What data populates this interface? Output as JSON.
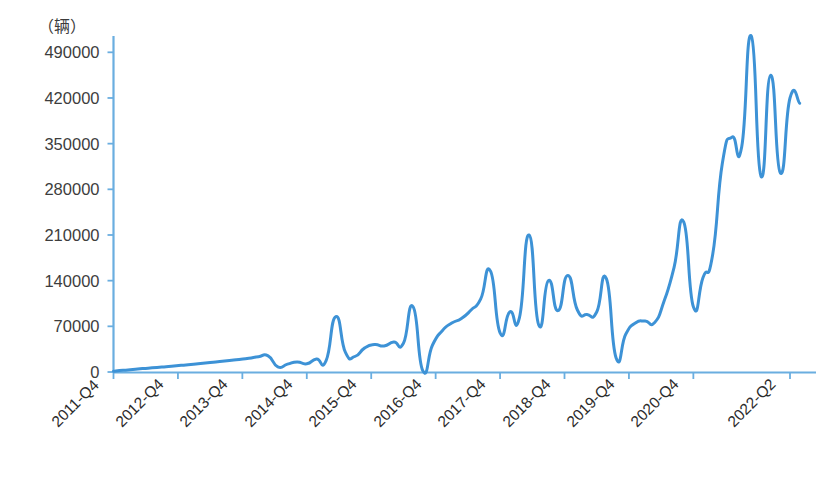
{
  "chart_data": {
    "type": "line",
    "title": "",
    "subtitle": "",
    "unit_label": "（辆）",
    "xlabel": "",
    "ylabel": "",
    "ylim": [
      0,
      515000
    ],
    "xlim": [
      0,
      43
    ],
    "grid": false,
    "legend": null,
    "legend_position": "none",
    "line_color": "#3d92d6",
    "axis_color": "#6aaee0",
    "text_color": "#333333",
    "y_ticks": [
      0,
      70000,
      140000,
      210000,
      280000,
      350000,
      420000,
      490000
    ],
    "y_tick_labels": [
      "0",
      "70000",
      "140000",
      "210000",
      "280000",
      "350000",
      "420000",
      "490000"
    ],
    "x_ticks": [
      "2011-Q4",
      "2012-Q4",
      "2013-Q4",
      "2014-Q4",
      "2015-Q4",
      "2016-Q4",
      "2017-Q4",
      "2018-Q4",
      "2019-Q4",
      "2020-Q4",
      "2022-Q2"
    ],
    "x_tick_indices": [
      0,
      4,
      8,
      12,
      16,
      20,
      24,
      28,
      32,
      36,
      42
    ],
    "series": [
      {
        "name": "monthly vehicle registrations",
        "color": "#3d92d6",
        "values": [
          1200,
          2600,
          3800,
          5200,
          6400,
          7600,
          8800,
          10200,
          11500,
          13000,
          14400,
          16000,
          17600,
          19200,
          21000,
          23500,
          24800,
          8000,
          12000,
          15500,
          12500,
          20000,
          17500,
          85000,
          30000,
          24000,
          37000,
          42000,
          40000,
          46000,
          44000,
          100000,
          2000,
          41000,
          63000,
          75000,
          82000,
          95000,
          112000,
          155000,
          60000,
          92000,
          83000,
          210000,
          72000,
          140000,
          94000,
          148000,
          95000,
          88000,
          92000,
          143000,
          22000,
          58000,
          75000,
          78000,
          76000,
          110000,
          160000,
          230000,
          100000,
          145000,
          180000,
          320000,
          360000,
          345000,
          515000,
          300000,
          455000,
          305000,
          420000,
          412000
        ]
      }
    ]
  }
}
